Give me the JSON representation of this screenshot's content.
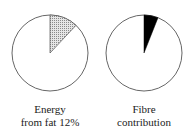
{
  "chart_data": [
    {
      "type": "pie",
      "title": "Energy from fat 12%",
      "caption_lines": [
        "Energy",
        "from fat 12%"
      ],
      "slices": [
        {
          "label": "Energy from fat",
          "value": 12,
          "fill": "hatched-grey"
        },
        {
          "label": "Other energy",
          "value": 88,
          "fill": "#ffffff"
        }
      ],
      "start_angle_deg": 0,
      "direction": "clockwise"
    },
    {
      "type": "pie",
      "title": "Fibre contribution",
      "caption_lines": [
        "Fibre",
        "contribution"
      ],
      "slices": [
        {
          "label": "Fibre contribution",
          "value": 6,
          "fill": "#000000"
        },
        {
          "label": "Other",
          "value": 94,
          "fill": "#ffffff"
        }
      ],
      "start_angle_deg": 0,
      "direction": "clockwise"
    }
  ],
  "captions": {
    "left": {
      "line1": "Energy",
      "line2": "from fat 12%"
    },
    "right": {
      "line1": "Fibre",
      "line2": "contribution"
    }
  },
  "colors": {
    "outline": "#555555",
    "hatch": "#9a9a9a",
    "fibre": "#000000"
  }
}
